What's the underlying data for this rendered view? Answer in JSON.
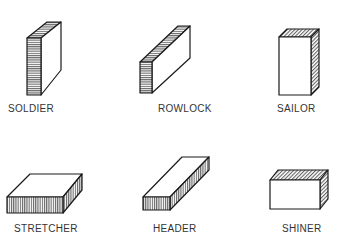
{
  "diagram": {
    "bricks": [
      {
        "id": "soldier",
        "label": "SOLDIER"
      },
      {
        "id": "rowlock",
        "label": "ROWLOCK"
      },
      {
        "id": "sailor",
        "label": "SAILOR"
      },
      {
        "id": "stretcher",
        "label": "STRETCHER"
      },
      {
        "id": "header",
        "label": "HEADER"
      },
      {
        "id": "shiner",
        "label": "SHINER"
      }
    ],
    "colors": {
      "line": "#1a1a1a",
      "label": "#333333",
      "background": "#ffffff"
    }
  }
}
